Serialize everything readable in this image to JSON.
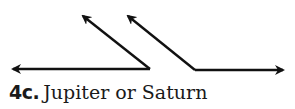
{
  "figure": {
    "cut_off_label": "2",
    "stroke_color": "#111111",
    "angles": [
      {
        "name": "left-angle",
        "vertex": [
          150,
          69
        ],
        "rays": [
          {
            "direction": "left",
            "tip": [
              11,
              69
            ]
          },
          {
            "direction": "up-left",
            "tip": [
              81,
              14
            ]
          }
        ]
      },
      {
        "name": "right-angle",
        "vertex": [
          195,
          70
        ],
        "rays": [
          {
            "direction": "up-left",
            "tip": [
              126,
              14
            ]
          },
          {
            "direction": "right",
            "tip": [
              285,
              70
            ]
          }
        ]
      }
    ]
  },
  "caption": {
    "number": "4c.",
    "text": "Jupiter or Saturn"
  }
}
